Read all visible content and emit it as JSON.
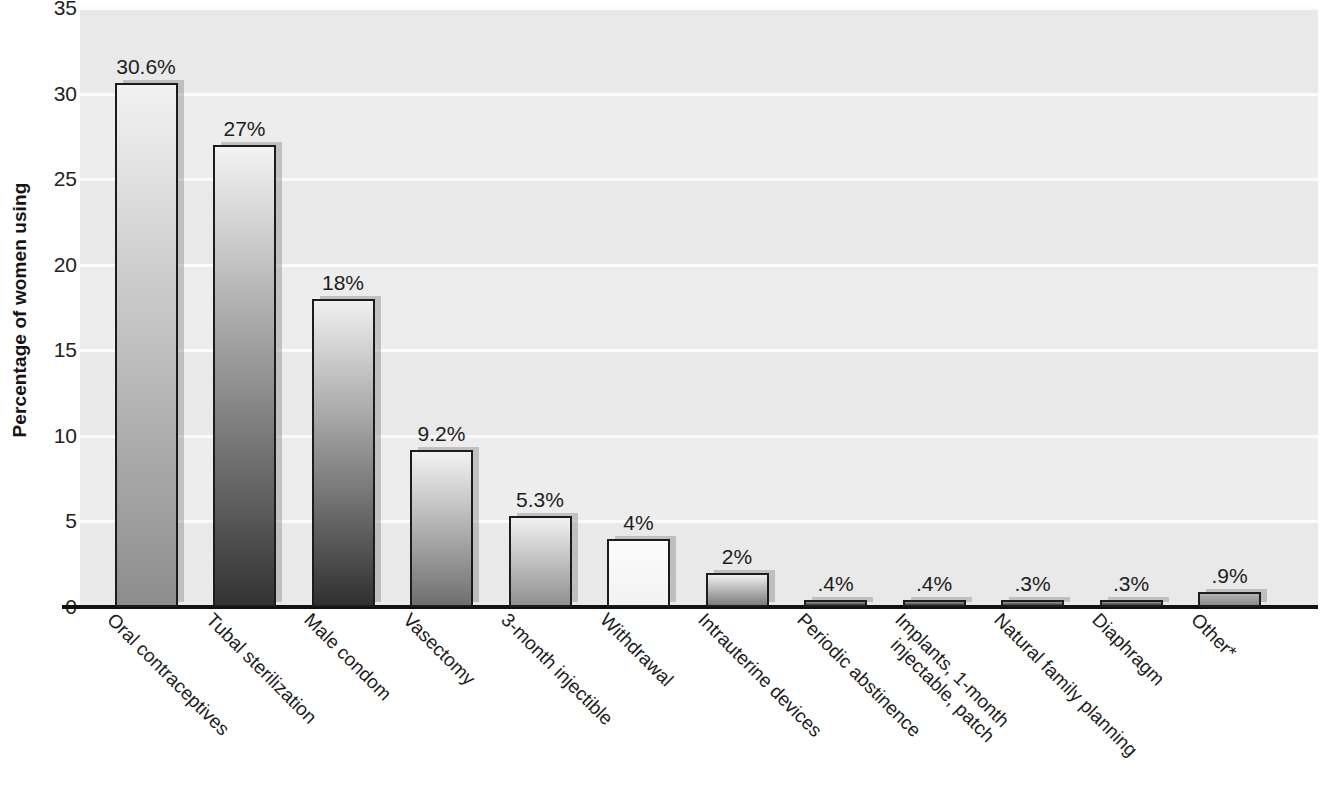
{
  "chart_data": {
    "type": "bar",
    "title": "",
    "xlabel": "",
    "ylabel": "Percentage of women using",
    "ylim": [
      0,
      35
    ],
    "grid": true,
    "legend": "none",
    "y_ticks": [
      "0",
      "5",
      "10",
      "15",
      "20",
      "25",
      "30",
      "35"
    ],
    "y_tick_values": [
      0,
      5,
      10,
      15,
      20,
      25,
      30,
      35
    ],
    "categories": [
      "Oral contraceptives",
      "Tubal sterilization",
      "Male condom",
      "Vasectomy",
      "3-month injectible",
      "Withdrawal",
      "Intrauterine devices",
      "Periodic abstinence",
      "Implants, 1-month injectable, patch",
      "Natural family planning",
      "Diaphragm",
      "Other*"
    ],
    "category_lines": [
      [
        "Oral contraceptives"
      ],
      [
        "Tubal sterilization"
      ],
      [
        "Male condom"
      ],
      [
        "Vasectomy"
      ],
      [
        "3-month injectible"
      ],
      [
        "Withdrawal"
      ],
      [
        "Intrauterine devices"
      ],
      [
        "Periodic abstinence"
      ],
      [
        "Implants, 1-month",
        "injectable, patch"
      ],
      [
        "Natural family planning"
      ],
      [
        "Diaphragm"
      ],
      [
        "Other*"
      ]
    ],
    "values": [
      30.6,
      27,
      18,
      9.2,
      5.3,
      4,
      2,
      0.4,
      0.4,
      0.3,
      0.3,
      0.9
    ],
    "data_labels": [
      "30.6%",
      "27%",
      "18%",
      "9.2%",
      "5.3%",
      "4%",
      "2%",
      ".4%",
      ".4%",
      ".3%",
      ".3%",
      ".9%"
    ],
    "bar_colors_top": [
      "#f2f2f2",
      "#f3f3f3",
      "#f0f0f0",
      "#f2f2f2",
      "#f1f1f1",
      "#fbfbfb",
      "#efefef",
      "#9a9a9a",
      "#9a9a9a",
      "#9e9e9e",
      "#9e9e9e",
      "#b4b4b4"
    ],
    "bar_colors_bottom": [
      "#8d8d8d",
      "#333333",
      "#303030",
      "#6f6f6f",
      "#909090",
      "#f3f3f3",
      "#7d7d7d",
      "#3a3a3a",
      "#3a3a3a",
      "#3d3d3d",
      "#3d3d3d",
      "#8a8a8a"
    ]
  },
  "axis": {
    "y_title": "Percentage of women using"
  },
  "colors": {
    "plot_background": "#ececec",
    "gridline": "#fbfbfb",
    "axis_line": "#111111",
    "bar_outline": "#1c1c1c",
    "text": "#1d1d1d"
  }
}
